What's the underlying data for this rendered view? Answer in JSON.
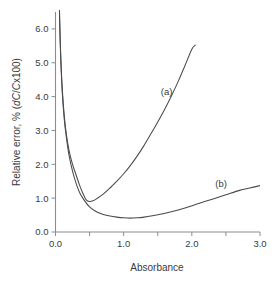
{
  "chart_data": {
    "type": "line",
    "title": "",
    "xlabel": "Absorbance",
    "ylabel": "Relative error, % (dC/Cx100)",
    "ylabel_parts": {
      "prefix": "Relative error, % (",
      "italic_d": "d",
      "italic_c1": "C",
      "slash": "/",
      "italic_c2": "C",
      "suffix": "x100)"
    },
    "xlim": [
      0.0,
      3.0
    ],
    "ylim": [
      0.0,
      6.5
    ],
    "grid": false,
    "legend_position": "inline-annotations",
    "xticks": [
      0.0,
      0.5,
      1.0,
      1.5,
      2.0,
      2.5,
      3.0
    ],
    "xtick_labels": [
      "0.0",
      "",
      "1.0",
      "",
      "2.0",
      "",
      "3.0"
    ],
    "yticks": [
      0.0,
      1.0,
      2.0,
      3.0,
      4.0,
      5.0,
      6.0
    ],
    "ytick_labels": [
      "0.0",
      "1.0",
      "2.0",
      "3.0",
      "4.0",
      "5.0",
      "6.0"
    ],
    "annotations": [
      {
        "text": "(a)",
        "x": 1.63,
        "y": 4.05
      },
      {
        "text": "(b)",
        "x": 2.43,
        "y": 1.33
      }
    ],
    "series": [
      {
        "name": "(a)",
        "label": "(a)",
        "color": "#4a4a4a",
        "x": [
          0.04,
          0.06,
          0.08,
          0.1,
          0.13,
          0.16,
          0.2,
          0.25,
          0.3,
          0.35,
          0.4,
          0.45,
          0.5,
          0.55,
          0.6,
          0.7,
          0.8,
          0.9,
          1.0,
          1.1,
          1.2,
          1.3,
          1.4,
          1.5,
          1.6,
          1.7,
          1.8,
          1.9,
          2.0,
          2.05
        ],
        "y": [
          8.8,
          6.4,
          5.05,
          4.2,
          3.4,
          2.88,
          2.4,
          2.0,
          1.7,
          1.4,
          1.15,
          0.95,
          0.9,
          0.92,
          0.98,
          1.12,
          1.3,
          1.5,
          1.72,
          1.97,
          2.25,
          2.56,
          2.9,
          3.25,
          3.62,
          4.02,
          4.45,
          4.92,
          5.4,
          5.52
        ]
      },
      {
        "name": "(b)",
        "label": "(b)",
        "color": "#4a4a4a",
        "x": [
          0.04,
          0.06,
          0.08,
          0.1,
          0.13,
          0.16,
          0.2,
          0.25,
          0.3,
          0.35,
          0.4,
          0.5,
          0.6,
          0.7,
          0.8,
          0.9,
          1.0,
          1.1,
          1.2,
          1.3,
          1.4,
          1.5,
          1.7,
          1.9,
          2.1,
          2.3,
          2.5,
          2.7,
          2.85,
          3.0
        ],
        "y": [
          8.7,
          6.3,
          4.95,
          4.1,
          3.3,
          2.78,
          2.25,
          1.8,
          1.45,
          1.18,
          1.0,
          0.74,
          0.6,
          0.52,
          0.47,
          0.44,
          0.42,
          0.41,
          0.42,
          0.44,
          0.47,
          0.51,
          0.6,
          0.71,
          0.84,
          0.97,
          1.1,
          1.23,
          1.3,
          1.37
        ]
      }
    ]
  }
}
